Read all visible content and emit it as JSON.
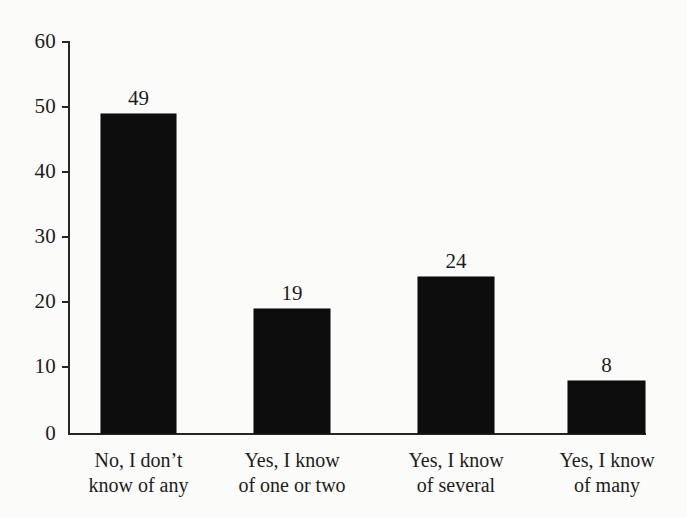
{
  "chart_data": {
    "type": "bar",
    "title": "",
    "subtitle": "",
    "xlabel": "",
    "ylabel": "",
    "categories": [
      "No, I don't know of any",
      "Yes, I know of one or two",
      "Yes, I know of several",
      "Yes, I know of many"
    ],
    "category_lines": [
      [
        "No, I don’t",
        "know of any"
      ],
      [
        "Yes, I know",
        "of one or two"
      ],
      [
        "Yes, I know",
        "of several"
      ],
      [
        "Yes, I know",
        "of many"
      ]
    ],
    "values": [
      49,
      19,
      24,
      8
    ],
    "value_labels": [
      "49",
      "19",
      "24",
      "8"
    ],
    "ylim": [
      0,
      60
    ],
    "yticks": [
      0,
      10,
      20,
      30,
      40,
      50,
      60
    ],
    "ytick_labels": [
      "0",
      "10",
      "20",
      "30",
      "40",
      "50",
      "60"
    ],
    "grid": false,
    "legend": false,
    "legend_position": "none",
    "bar_color": "#0d0d0d",
    "axis_color": "#262626",
    "background_color": "#fbfbf9"
  }
}
